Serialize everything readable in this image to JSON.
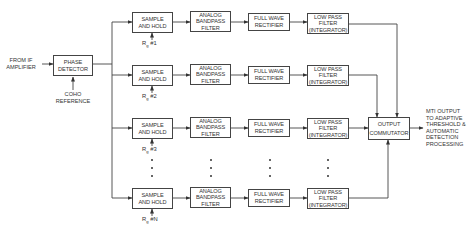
{
  "inputs": {
    "if_amplifier": [
      "FROM IF",
      "AMPLIFIER"
    ],
    "coho": [
      "COHO",
      "REFERENCE"
    ]
  },
  "phase_detector": [
    "PHASE",
    "DETECTOR"
  ],
  "channels": [
    {
      "sample_hold": [
        "SAMPLE",
        "AND HOLD"
      ],
      "rg_label": "R",
      "rg_sub": "g",
      "rg_index": "#1",
      "bandpass": [
        "ANALOG",
        "BANDPASS",
        "FILTER"
      ],
      "rectifier": [
        "FULL WAVE",
        "RECTIFIER"
      ],
      "lowpass": [
        "LOW PASS",
        "FILTER",
        "(INTEGRATOR)"
      ]
    },
    {
      "sample_hold": [
        "SAMPLE",
        "AND HOLD"
      ],
      "rg_label": "R",
      "rg_sub": "g",
      "rg_index": "#2",
      "bandpass": [
        "ANALOG",
        "BANDPASS",
        "FILTER"
      ],
      "rectifier": [
        "FULL WAVE",
        "RECTIFIER"
      ],
      "lowpass": [
        "LOW PASS",
        "FILTER",
        "(INTEGRATOR)"
      ]
    },
    {
      "sample_hold": [
        "SAMPLE",
        "AND HOLD"
      ],
      "rg_label": "R",
      "rg_sub": "g",
      "rg_index": "#3",
      "bandpass": [
        "ANALOG",
        "BANDPASS",
        "FILTER"
      ],
      "rectifier": [
        "FULL WAVE",
        "RECTIFIER"
      ],
      "lowpass": [
        "LOW PASS",
        "FILTER",
        "(INTEGRATOR)"
      ]
    },
    {
      "sample_hold": [
        "SAMPLE",
        "AND HOLD"
      ],
      "rg_label": "R",
      "rg_sub": "g",
      "rg_index": "#N",
      "bandpass": [
        "ANALOG",
        "BANDPASS",
        "FILTER"
      ],
      "rectifier": [
        "FULL WAVE",
        "RECTIFIER"
      ],
      "lowpass": [
        "LOW PASS",
        "FILTER",
        "(INTEGRATOR)"
      ]
    }
  ],
  "commutator": [
    "OUTPUT",
    "COMMUTATOR"
  ],
  "output": [
    "MTI OUTPUT",
    "TO ADAPTIVE",
    "THRESHOLD &",
    "AUTOMATIC",
    "DETECTION",
    "PROCESSING"
  ],
  "colors": {
    "line": "#444444",
    "text": "#333333",
    "background": "#ffffff"
  }
}
